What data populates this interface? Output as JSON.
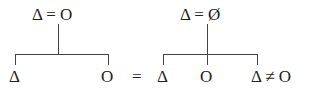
{
  "diagram": {
    "left_tree": {
      "root": "Δ = O",
      "children": [
        "Δ",
        "O"
      ]
    },
    "equals": "=",
    "right_tree": {
      "root": "Δ = Ø",
      "children": [
        "Δ",
        "O",
        "Δ ≠ O"
      ]
    }
  }
}
